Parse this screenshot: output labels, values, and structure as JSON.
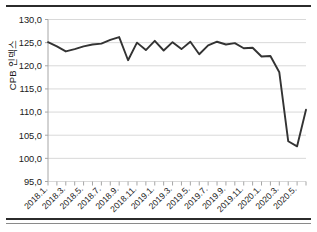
{
  "chart_data": {
    "type": "line",
    "title": "",
    "xlabel": "",
    "ylabel": "CPB 인덱스",
    "ylim": [
      95.0,
      130.0
    ],
    "yticks": [
      "95,0",
      "100,0",
      "105,0",
      "110,0",
      "115,0",
      "120,0",
      "125,0",
      "130,0"
    ],
    "ytick_values": [
      95.0,
      100.0,
      105.0,
      110.0,
      115.0,
      120.0,
      125.0,
      130.0
    ],
    "grid": "horizontal",
    "legend": "none",
    "decimal_separator": ",",
    "line_color": "#333333",
    "grid_color": "#d9d9d9",
    "axis_color": "#a6a6a6",
    "x": [
      "2018.1.",
      "2018.2.",
      "2018.3.",
      "2018.4.",
      "2018.5.",
      "2018.6.",
      "2018.7.",
      "2018.8.",
      "2018.9.",
      "2018.10.",
      "2018.11.",
      "2018.12.",
      "2019.1.",
      "2019.2.",
      "2019.3.",
      "2019.4.",
      "2019.5.",
      "2019.6.",
      "2019.7.",
      "2019.8.",
      "2019.9.",
      "2019.10.",
      "2019.11.",
      "2019.12.",
      "2020.1.",
      "2020.2.",
      "2020.3.",
      "2020.4.",
      "2020.5.",
      "2020.6."
    ],
    "xtick_labels": [
      "2018.1.",
      "2018.3.",
      "2018.5.",
      "2018.7.",
      "2018.9.",
      "2018.11.",
      "2019.1.",
      "2019.3.",
      "2019.5.",
      "2019.7.",
      "2019.9.",
      "2019.11.",
      "2020.1.",
      "2020.3.",
      "2020.5."
    ],
    "values": [
      125.1,
      124.2,
      123.1,
      123.6,
      124.2,
      124.6,
      124.8,
      125.6,
      126.2,
      121.2,
      125.0,
      123.4,
      125.4,
      123.3,
      125.1,
      123.6,
      125.2,
      122.5,
      124.4,
      125.2,
      124.6,
      124.9,
      123.8,
      123.9,
      122.0,
      122.1,
      118.6,
      103.7,
      102.6,
      110.5
    ]
  }
}
